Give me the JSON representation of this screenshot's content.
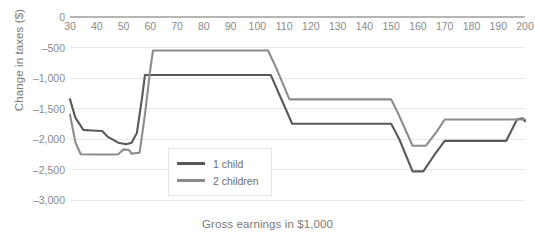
{
  "chart_data": {
    "type": "line",
    "title": "",
    "xlabel": "Gross earnings in $1,000",
    "ylabel": "Change in taxes ($)",
    "xlim": [
      30,
      200
    ],
    "ylim": [
      -3000,
      0
    ],
    "xticks": [
      30,
      40,
      50,
      60,
      70,
      80,
      90,
      100,
      110,
      120,
      130,
      140,
      150,
      160,
      170,
      180,
      190,
      200
    ],
    "xtick_labels": [
      "30",
      "40",
      "50",
      "60",
      "70",
      "80",
      "90",
      "100",
      "110",
      "120",
      "130",
      "140",
      "150",
      "160",
      "170",
      "180",
      "190",
      "200"
    ],
    "yticks": [
      0,
      -500,
      -1000,
      -1500,
      -2000,
      -2500,
      -3000
    ],
    "ytick_labels": [
      "0",
      "–500",
      "–1,000",
      "–1,500",
      "–2,000",
      "–2,500",
      "–3,000"
    ],
    "grid": true,
    "legend_position": "center-left",
    "series": [
      {
        "name": "1 child",
        "color": "#595959",
        "points": [
          [
            30,
            -1350
          ],
          [
            32,
            -1650
          ],
          [
            35,
            -1850
          ],
          [
            38,
            -1860
          ],
          [
            42,
            -1870
          ],
          [
            44,
            -1960
          ],
          [
            48,
            -2060
          ],
          [
            51,
            -2085
          ],
          [
            53,
            -2060
          ],
          [
            55,
            -1900
          ],
          [
            57,
            -1300
          ],
          [
            58,
            -950
          ],
          [
            62,
            -950
          ],
          [
            80,
            -950
          ],
          [
            100,
            -950
          ],
          [
            105,
            -950
          ],
          [
            108,
            -1250
          ],
          [
            113,
            -1750
          ],
          [
            130,
            -1750
          ],
          [
            150,
            -1750
          ],
          [
            153,
            -2000
          ],
          [
            158,
            -2530
          ],
          [
            162,
            -2530
          ],
          [
            166,
            -2270
          ],
          [
            170,
            -2030
          ],
          [
            180,
            -2030
          ],
          [
            190,
            -2030
          ],
          [
            193,
            -2030
          ],
          [
            197,
            -1680
          ],
          [
            199,
            -1660
          ],
          [
            200,
            -1710
          ]
        ]
      },
      {
        "name": "2 children",
        "color": "#8c8c8c",
        "points": [
          [
            30,
            -1600
          ],
          [
            32,
            -2050
          ],
          [
            34,
            -2250
          ],
          [
            40,
            -2255
          ],
          [
            46,
            -2255
          ],
          [
            48,
            -2250
          ],
          [
            50,
            -2170
          ],
          [
            52,
            -2180
          ],
          [
            53,
            -2240
          ],
          [
            55,
            -2230
          ],
          [
            56,
            -2225
          ],
          [
            58,
            -1600
          ],
          [
            60,
            -860
          ],
          [
            61,
            -550
          ],
          [
            70,
            -550
          ],
          [
            90,
            -550
          ],
          [
            104,
            -550
          ],
          [
            107,
            -830
          ],
          [
            112,
            -1350
          ],
          [
            130,
            -1350
          ],
          [
            150,
            -1350
          ],
          [
            153,
            -1620
          ],
          [
            158,
            -2110
          ],
          [
            163,
            -2110
          ],
          [
            167,
            -1880
          ],
          [
            170,
            -1680
          ],
          [
            185,
            -1680
          ],
          [
            200,
            -1680
          ]
        ]
      }
    ]
  },
  "legend": {
    "items": [
      {
        "label": "1 child",
        "color": "#595959"
      },
      {
        "label": "2 children",
        "color": "#8c8c8c"
      }
    ]
  },
  "style": {
    "grid_color": "#e8e8e8",
    "axis_color": "#b5b5b5",
    "tick_text_color": "#8a8a8a",
    "background": "#ffffff"
  }
}
